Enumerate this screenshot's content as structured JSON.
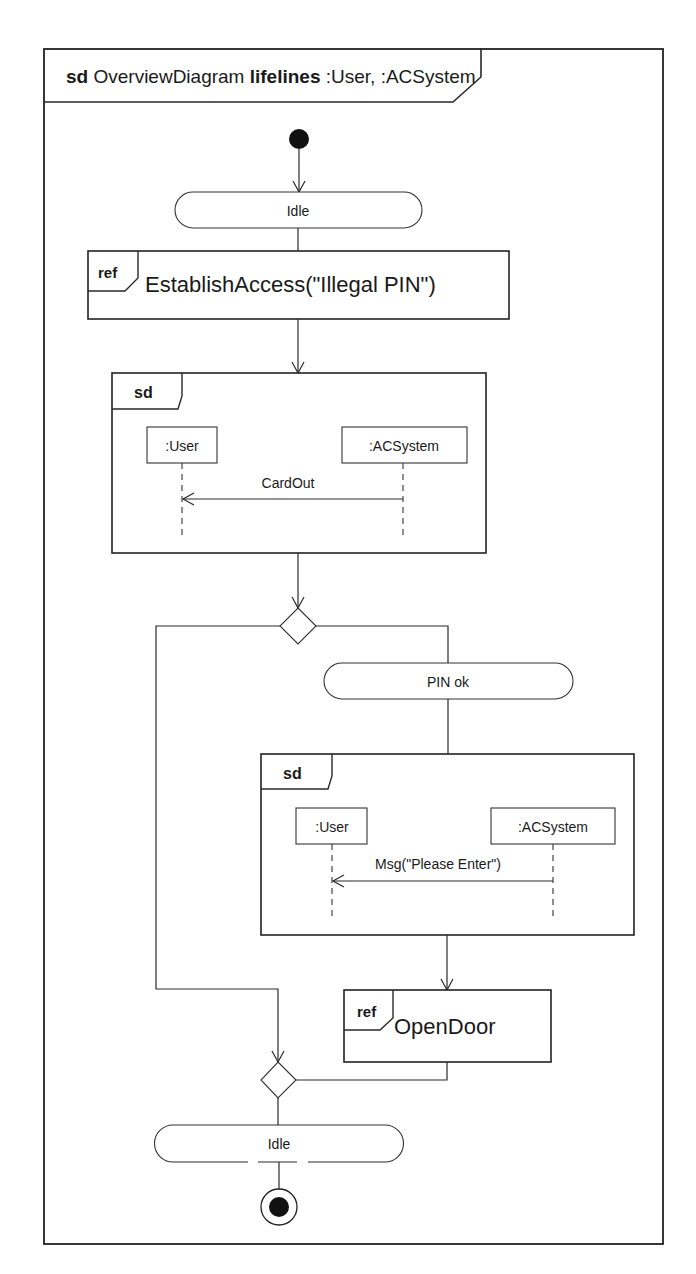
{
  "frame": {
    "keyword": "sd",
    "name": "OverviewDiagram",
    "lifelines_keyword": "lifelines",
    "lifelines": ":User, :ACSystem"
  },
  "nodes": {
    "initial": {
      "type": "initial-node"
    },
    "idle_top": {
      "label": "Idle"
    },
    "ref_establish": {
      "tag": "ref",
      "label": "EstablishAccess(\"Illegal PIN\")"
    },
    "sd_cardout": {
      "tag": "sd",
      "lifeline_left": ":User",
      "lifeline_right": ":ACSystem",
      "message": "CardOut"
    },
    "decision": {
      "type": "decision-node"
    },
    "pin_ok": {
      "label": "PIN ok"
    },
    "sd_please_enter": {
      "tag": "sd",
      "lifeline_left": ":User",
      "lifeline_right": ":ACSystem",
      "message": "Msg(\"Please Enter\")"
    },
    "ref_open_door": {
      "tag": "ref",
      "label": "OpenDoor"
    },
    "merge": {
      "type": "merge-node"
    },
    "idle_bottom": {
      "label": "Idle"
    },
    "final": {
      "type": "final-node"
    }
  },
  "colors": {
    "line": "#222222",
    "background": "#ffffff",
    "text": "#1a1a1a"
  }
}
